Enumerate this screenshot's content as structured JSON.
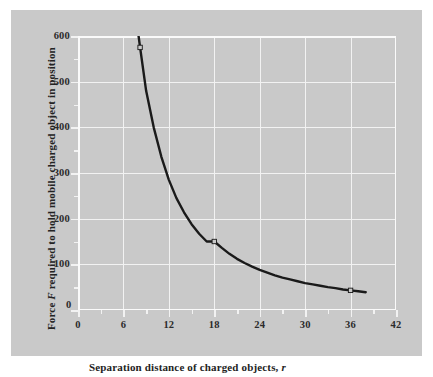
{
  "figure": {
    "background_color": "#c9c9c9",
    "page_color": "#ffffff",
    "grid_color": "#f2f2f2",
    "curve_color": "#1a1a1a",
    "text_color": "#232323"
  },
  "axes": {
    "x_title_prefix": "Separation distance of charged objects, ",
    "x_title_variable": "r",
    "y_title_prefix": "Force ",
    "y_title_variable": "F",
    "y_title_suffix": " required to hold mobile charged object in position",
    "origin_label": "0"
  },
  "chart_data": {
    "type": "line",
    "title": "",
    "subtitle": "",
    "xlabel": "Separation distance of charged objects, r",
    "ylabel": "Force F required to hold mobile charged object in position",
    "xlim": [
      0,
      42
    ],
    "ylim": [
      0,
      600
    ],
    "xticks": [
      0,
      6,
      12,
      18,
      24,
      30,
      36,
      42
    ],
    "xtick_labels": [
      "0",
      "6",
      "12",
      "18",
      "24",
      "30",
      "36",
      "42"
    ],
    "xminor_ticks": [
      3,
      9,
      15,
      21,
      27,
      33,
      39
    ],
    "yticks": [
      0,
      100,
      200,
      300,
      400,
      500,
      600
    ],
    "ytick_labels": [
      "0",
      "100",
      "200",
      "300",
      "400",
      "500",
      "600"
    ],
    "yminor_ticks": [
      50,
      150,
      250,
      350,
      450,
      550
    ],
    "grid": true,
    "grid_axes": "both",
    "legend": false,
    "legend_position": "none",
    "relation": "inverse-square",
    "series": [
      {
        "name": "Force vs separation",
        "x": [
          8.0,
          8.2,
          9,
          10,
          11,
          12,
          13,
          14,
          15,
          16,
          17,
          18,
          19,
          20,
          21,
          22,
          23,
          24,
          25,
          26,
          27,
          28,
          29,
          30,
          31,
          32,
          33,
          34,
          35,
          36,
          37,
          38
        ],
        "values": [
          600,
          575,
          480,
          400,
          336,
          285,
          245,
          214,
          188,
          167,
          150,
          150,
          136,
          123,
          112,
          103,
          95,
          88,
          82,
          76,
          71,
          67,
          63,
          59,
          56,
          53,
          50,
          48,
          45,
          43,
          41,
          39
        ]
      }
    ],
    "markers": [
      {
        "x": 8.2,
        "y": 575,
        "label": ""
      },
      {
        "x": 18,
        "y": 150,
        "label": ""
      },
      {
        "x": 36,
        "y": 43,
        "label": ""
      }
    ]
  }
}
